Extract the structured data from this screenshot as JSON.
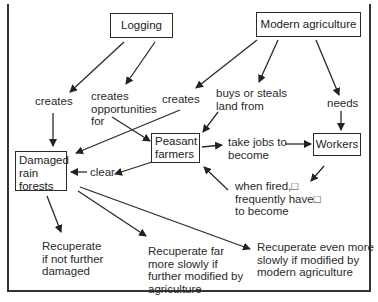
{
  "diagram": {
    "nodes": {
      "logging": "Logging",
      "modern_agriculture": "Modern agriculture",
      "damaged_rain_forests": "Damaged\nrain\nforests",
      "peasant_farmers": "Peasant\nfarmers",
      "workers": "Workers"
    },
    "edge_labels": {
      "logging_creates": "creates",
      "logging_opportunities": "creates\nopportunities\nfor",
      "agriculture_creates": "creates",
      "agriculture_buys": "buys or steals\nland from",
      "agriculture_needs": "needs",
      "peasants_take_jobs": "take jobs to\nbecome",
      "workers_fired": "when fired,□\nfrequently have□\nto become",
      "peasants_clear": "clear"
    },
    "outcomes": {
      "recuperate_not_damaged": "Recuperate\nif not further\ndamaged",
      "recuperate_far_slowly": "Recuperate far\nmore slowly if\nfurther modified by\nagriculture",
      "recuperate_even_slower": "Recuperate even more\nslowly if modified by\nmodern agriculture"
    },
    "colors": {
      "line": "#2a2a2a",
      "background": "#ffffff"
    }
  }
}
